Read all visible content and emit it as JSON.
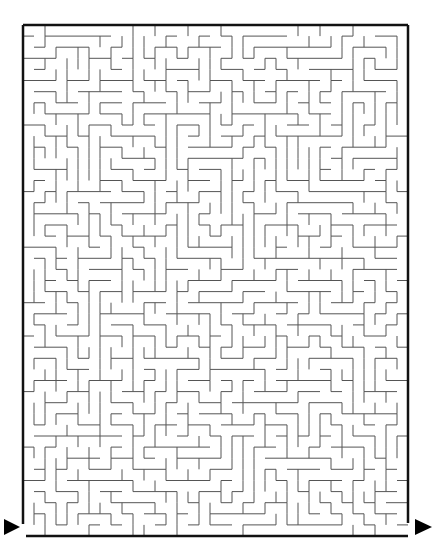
{
  "puzzle": {
    "type": "maze",
    "colors": {
      "background": "#ffffff",
      "wall": "#555555",
      "frame": "#111111",
      "arrow": "#000000"
    },
    "frame": {
      "left": 23,
      "top": 25,
      "right": 408,
      "bottom": 536
    },
    "grid": {
      "cols": 35,
      "rows": 46,
      "cell": 11
    },
    "entrance": {
      "label": "start-arrow",
      "side": "left",
      "y": 527
    },
    "exit": {
      "label": "end-arrow",
      "side": "right",
      "y": 527
    }
  }
}
